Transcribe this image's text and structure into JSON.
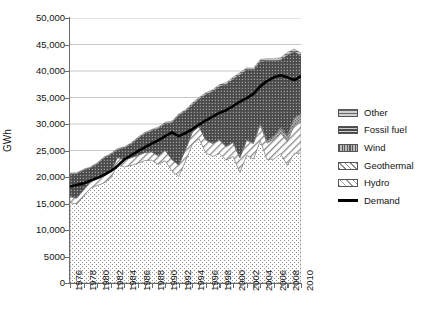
{
  "chart_data": {
    "type": "area",
    "title": "",
    "subtitle": "",
    "xlabel": "",
    "ylabel": "GWh",
    "xlim": [
      1976,
      2010
    ],
    "ylim": [
      0,
      50000
    ],
    "grid": "horizontal",
    "legend_position": "right",
    "stacked": true,
    "x": [
      1976,
      1977,
      1978,
      1979,
      1980,
      1981,
      1982,
      1983,
      1984,
      1985,
      1986,
      1987,
      1988,
      1989,
      1990,
      1991,
      1992,
      1993,
      1994,
      1995,
      1996,
      1997,
      1998,
      1999,
      2000,
      2001,
      2002,
      2003,
      2004,
      2005,
      2006,
      2007,
      2008,
      2009,
      2010
    ],
    "xtick_labels": [
      "1976",
      "1978",
      "1980",
      "1982",
      "1984",
      "1986",
      "1988",
      "1990",
      "1992",
      "1994",
      "1996",
      "1998",
      "2000",
      "2002",
      "2004",
      "2006",
      "2008",
      "2010"
    ],
    "ytick_labels": [
      "0",
      "5000",
      "10,000",
      "15,000",
      "20,000",
      "25,000",
      "30,000",
      "35,000",
      "40,000",
      "45,000",
      "50,000"
    ],
    "ytick_values": [
      0,
      5000,
      10000,
      15000,
      20000,
      25000,
      30000,
      35000,
      40000,
      45000,
      50000
    ],
    "series": [
      {
        "name": "Hydro",
        "pattern": "fine-dots",
        "color": "#f2f2f2",
        "values": [
          15200,
          14900,
          16400,
          17900,
          18400,
          18900,
          19800,
          22300,
          21900,
          22200,
          22600,
          23100,
          23200,
          22400,
          23100,
          21200,
          20100,
          23000,
          26200,
          27200,
          24600,
          23900,
          24500,
          23200,
          23900,
          20900,
          24100,
          23400,
          26900,
          23300,
          23400,
          24400,
          22200,
          24500,
          24500
        ]
      },
      {
        "name": "Geothermal",
        "pattern": "diagonal-hatch",
        "color": "#dcdcdc",
        "values": [
          1100,
          1150,
          1200,
          1250,
          1300,
          1300,
          1350,
          1400,
          1400,
          1450,
          1500,
          1500,
          1550,
          1600,
          2000,
          2100,
          2150,
          2200,
          2250,
          2300,
          2350,
          2400,
          2450,
          2500,
          2600,
          2700,
          2800,
          2900,
          3000,
          3100,
          3700,
          4000,
          4500,
          5300,
          5800
        ]
      },
      {
        "name": "Wind",
        "pattern": "coarse-dots",
        "color": "#a8a8a8",
        "values": [
          0,
          0,
          0,
          0,
          0,
          0,
          0,
          0,
          0,
          0,
          0,
          0,
          0,
          0,
          0,
          0,
          0,
          30,
          40,
          50,
          60,
          70,
          80,
          90,
          110,
          130,
          150,
          170,
          300,
          450,
          620,
          900,
          1150,
          1400,
          1600
        ]
      },
      {
        "name": "Fossil fuel",
        "pattern": "dark-dots",
        "color": "#4a4a4a",
        "values": [
          4300,
          4600,
          3700,
          2600,
          2800,
          3400,
          3100,
          1500,
          2200,
          2600,
          3200,
          3600,
          4000,
          5200,
          5000,
          7000,
          9400,
          7200,
          5200,
          5200,
          8600,
          9800,
          10100,
          11700,
          11900,
          15600,
          13200,
          13700,
          11600,
          15100,
          14200,
          12800,
          15200,
          12500,
          11000
        ]
      },
      {
        "name": "Other",
        "pattern": "horizontal-lines",
        "color": "#9a9a9a",
        "values": [
          150,
          150,
          150,
          160,
          160,
          170,
          170,
          180,
          180,
          190,
          190,
          200,
          200,
          210,
          220,
          230,
          240,
          250,
          260,
          270,
          280,
          290,
          300,
          310,
          320,
          330,
          340,
          350,
          360,
          380,
          400,
          420,
          440,
          460,
          480
        ]
      }
    ],
    "overlay_line": {
      "name": "Demand",
      "color": "#000000",
      "values": [
        18200,
        18500,
        18800,
        19300,
        19800,
        20400,
        21100,
        22100,
        23300,
        24100,
        24900,
        25600,
        26300,
        26900,
        27700,
        28400,
        27700,
        28300,
        29000,
        29900,
        30700,
        31400,
        32100,
        32600,
        33400,
        34200,
        34900,
        35700,
        37100,
        38100,
        38800,
        39200,
        38800,
        38300,
        39000
      ]
    }
  },
  "axis": {
    "y_title": "GWh"
  },
  "legend": {
    "items": [
      {
        "label": "Other",
        "swatch": "other-swatch"
      },
      {
        "label": "Fossil fuel",
        "swatch": "fossil-fuel-swatch"
      },
      {
        "label": "Wind",
        "swatch": "wind-swatch"
      },
      {
        "label": "Geothermal",
        "swatch": "geothermal-swatch"
      },
      {
        "label": "Hydro",
        "swatch": "hydro-swatch"
      },
      {
        "label": "Demand",
        "swatch": "demand-swatch"
      }
    ]
  }
}
